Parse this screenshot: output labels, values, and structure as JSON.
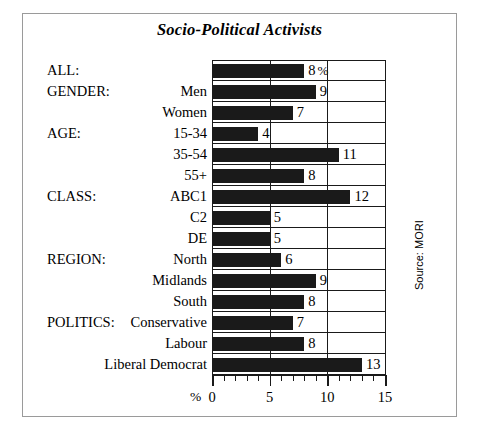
{
  "chart_data": {
    "type": "bar",
    "orientation": "horizontal",
    "title": "Socio-Political Activists",
    "xlabel": "%",
    "ylabel": "",
    "xlim": [
      0,
      15
    ],
    "xticks": [
      0,
      5,
      10,
      15
    ],
    "xtick_labels": [
      "0",
      "5",
      "10",
      "15"
    ],
    "minor_tick_interval": 1,
    "grid": true,
    "legend": null,
    "source": "Source: MORI",
    "value_suffix_first": "%",
    "bar_color": "#1a1a1a",
    "categories": [
      "ALL:",
      "Men",
      "Women",
      "15-34",
      "35-54",
      "55+",
      "ABC1",
      "C2",
      "DE",
      "North",
      "Midlands",
      "South",
      "Conservative",
      "Labour",
      "Liberal Democrat"
    ],
    "values": [
      8,
      9,
      7,
      4,
      11,
      8,
      12,
      5,
      5,
      6,
      9,
      8,
      7,
      8,
      13
    ],
    "rows": [
      {
        "group": "ALL:",
        "label": "",
        "value": 8,
        "value_text": "8",
        "suffix": "%"
      },
      {
        "group": "GENDER:",
        "label": "Men",
        "value": 9,
        "value_text": "9",
        "suffix": ""
      },
      {
        "group": "",
        "label": "Women",
        "value": 7,
        "value_text": "7",
        "suffix": ""
      },
      {
        "group": "AGE:",
        "label": "15-34",
        "value": 4,
        "value_text": "4",
        "suffix": ""
      },
      {
        "group": "",
        "label": "35-54",
        "value": 11,
        "value_text": "11",
        "suffix": ""
      },
      {
        "group": "",
        "label": "55+",
        "value": 8,
        "value_text": "8",
        "suffix": ""
      },
      {
        "group": "CLASS:",
        "label": "ABC1",
        "value": 12,
        "value_text": "12",
        "suffix": ""
      },
      {
        "group": "",
        "label": "C2",
        "value": 5,
        "value_text": "5",
        "suffix": ""
      },
      {
        "group": "",
        "label": "DE",
        "value": 5,
        "value_text": "5",
        "suffix": ""
      },
      {
        "group": "REGION:",
        "label": "North",
        "value": 6,
        "value_text": "6",
        "suffix": ""
      },
      {
        "group": "",
        "label": "Midlands",
        "value": 9,
        "value_text": "9",
        "suffix": ""
      },
      {
        "group": "",
        "label": "South",
        "value": 8,
        "value_text": "8",
        "suffix": ""
      },
      {
        "group": "POLITICS:",
        "label": "Conservative",
        "value": 7,
        "value_text": "7",
        "suffix": ""
      },
      {
        "group": "",
        "label": "Labour",
        "value": 8,
        "value_text": "8",
        "suffix": ""
      },
      {
        "group": "",
        "label": "Liberal Democrat",
        "value": 13,
        "value_text": "13",
        "suffix": ""
      }
    ]
  },
  "layout": {
    "plot_left_px": 212,
    "plot_right_px": 385,
    "plot_top_px": 60,
    "row_height_px": 21
  }
}
